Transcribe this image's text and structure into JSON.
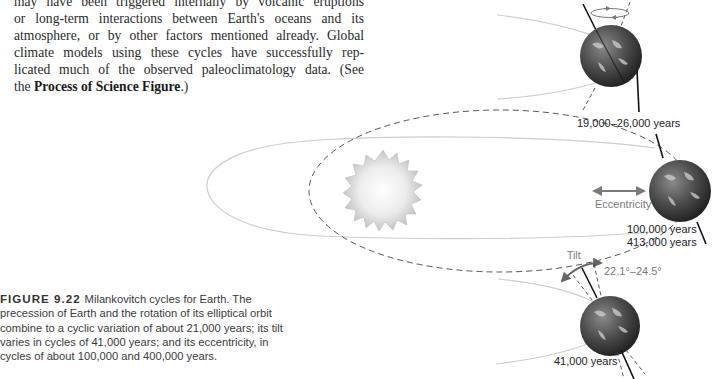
{
  "body_text": {
    "lines": [
      "may have been triggered internally by volcanic eruptions",
      "or long-term interactions between Earth's oceans and its",
      "atmosphere, or by other factors mentioned already. Global",
      "climate models using these cycles have successfully rep-",
      "licated much of the observed paleoclimatology data. (See"
    ],
    "last_line_prefix": "the ",
    "last_line_bold": "Process of Science Figure",
    "last_line_suffix": ".)"
  },
  "caption": {
    "label": "FIGURE 9.22",
    "text": "Milankovitch cycles for Earth. The precession of Earth and the rotation of its elliptical orbit combine to a cyclic variation of about 21,000 years; its tilt varies in cycles of 41,000 years; and its eccentricity, in cycles of about 100,000 and 400,000 years."
  },
  "figure": {
    "precession": {
      "label": "19,000–26,000 years"
    },
    "eccentricity": {
      "arrow_label": "Eccentricity",
      "period_1": "100,000 years",
      "period_2": "413,000 years"
    },
    "tilt": {
      "title": "Tilt",
      "range": "22.1°–24.5°",
      "period": "41,000 years"
    },
    "colors": {
      "orbit": "#c8c8c8",
      "dashed_orbit": "#555555",
      "arrow": "#7a7a7a",
      "sun": "#e0e0e0",
      "earth_dark": "#3a3a3a",
      "axis": "#111111"
    }
  }
}
